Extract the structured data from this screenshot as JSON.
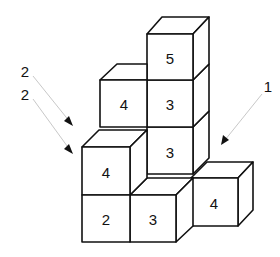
{
  "diagram": {
    "cubes": [
      {
        "id": "top",
        "label": "5"
      },
      {
        "id": "mid-upper",
        "label": "3"
      },
      {
        "id": "mid-lower",
        "label": "3"
      },
      {
        "id": "left-upper",
        "label": "4"
      },
      {
        "id": "left-lower-top",
        "label": "4"
      },
      {
        "id": "left-bottom",
        "label": "2"
      },
      {
        "id": "center-bottom",
        "label": "3"
      },
      {
        "id": "right-bottom",
        "label": "4"
      }
    ],
    "arrows": {
      "left_labels": [
        "2",
        "2"
      ],
      "right_label": "1"
    },
    "colors": {
      "stroke": "#111111",
      "arrow_line": "#c8c8c8",
      "background": "#ffffff"
    }
  }
}
